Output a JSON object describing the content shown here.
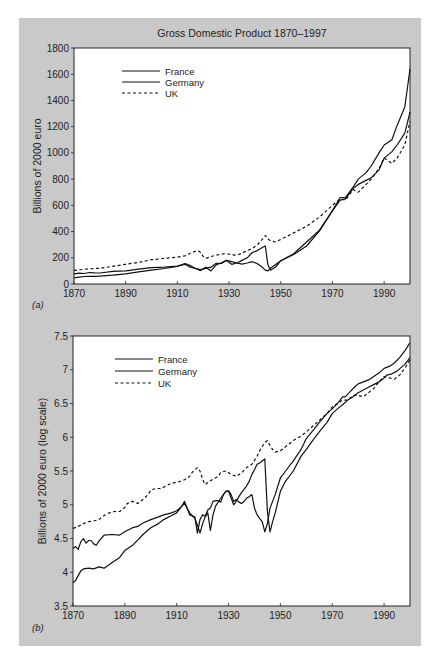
{
  "chart_data": [
    {
      "id": "a",
      "panel_label": "(a)",
      "type": "line",
      "title": "Gross Domestic Product 1870–1997",
      "xlabel": "",
      "ylabel": "Billions of 2000 euro",
      "xlim": [
        1870,
        2000
      ],
      "ylim": [
        0,
        1800
      ],
      "xticks": [
        1870,
        1890,
        1910,
        1930,
        1950,
        1970,
        1990
      ],
      "yticks": [
        0,
        200,
        400,
        600,
        800,
        1000,
        1200,
        1400,
        1600,
        1800
      ],
      "ytick_labels": [
        "0",
        "200",
        "400",
        "600",
        "800",
        "1000",
        "1200",
        "1400",
        "1600",
        "1800"
      ],
      "grid": false,
      "legend": "top-left",
      "series": [
        {
          "name": "France",
          "style": "solid",
          "x": [
            1870,
            1872,
            1874,
            1876,
            1878,
            1880,
            1885,
            1890,
            1895,
            1900,
            1905,
            1910,
            1912,
            1913,
            1915,
            1917,
            1919,
            1921,
            1923,
            1925,
            1927,
            1929,
            1931,
            1933,
            1935,
            1937,
            1939,
            1941,
            1943,
            1944,
            1945,
            1946,
            1948,
            1950,
            1955,
            1960,
            1965,
            1970,
            1973,
            1975,
            1978,
            1980,
            1983,
            1985,
            1988,
            1990,
            1993,
            1995,
            1998,
            2000
          ],
          "y": [
            77,
            82,
            80,
            88,
            85,
            84,
            96,
            100,
            113,
            125,
            128,
            136,
            145,
            150,
            128,
            118,
            110,
            120,
            128,
            158,
            156,
            180,
            170,
            160,
            152,
            160,
            170,
            155,
            125,
            105,
            100,
            120,
            148,
            178,
            230,
            320,
            410,
            560,
            660,
            660,
            740,
            800,
            850,
            900,
            1000,
            1060,
            1100,
            1210,
            1350,
            1640
          ]
        },
        {
          "name": "Germany",
          "style": "solid",
          "x": [
            1870,
            1872,
            1874,
            1876,
            1878,
            1880,
            1885,
            1890,
            1895,
            1900,
            1905,
            1910,
            1912,
            1913,
            1915,
            1917,
            1919,
            1921,
            1923,
            1925,
            1927,
            1929,
            1931,
            1933,
            1935,
            1937,
            1939,
            1941,
            1943,
            1944,
            1945,
            1946,
            1948,
            1950,
            1955,
            1960,
            1965,
            1970,
            1973,
            1975,
            1978,
            1980,
            1983,
            1985,
            1988,
            1990,
            1993,
            1995,
            1998,
            2000
          ],
          "y": [
            47,
            52,
            57,
            58,
            58,
            60,
            68,
            78,
            92,
            106,
            118,
            134,
            150,
            156,
            140,
            118,
            102,
            128,
            100,
            146,
            162,
            180,
            150,
            160,
            180,
            200,
            240,
            255,
            280,
            290,
            150,
            105,
            130,
            178,
            225,
            290,
            405,
            560,
            640,
            650,
            730,
            760,
            790,
            810,
            870,
            960,
            1010,
            1060,
            1150,
            1310
          ]
        },
        {
          "name": "UK",
          "style": "dashed",
          "x": [
            1870,
            1872,
            1874,
            1876,
            1878,
            1880,
            1885,
            1890,
            1895,
            1900,
            1905,
            1910,
            1913,
            1915,
            1917,
            1918,
            1919,
            1920,
            1921,
            1923,
            1925,
            1927,
            1929,
            1931,
            1933,
            1935,
            1937,
            1939,
            1941,
            1943,
            1944,
            1945,
            1946,
            1948,
            1950,
            1955,
            1960,
            1965,
            1970,
            1973,
            1975,
            1978,
            1980,
            1983,
            1985,
            1988,
            1990,
            1993,
            1995,
            1998,
            2000
          ],
          "y": [
            102,
            108,
            112,
            116,
            118,
            120,
            135,
            150,
            165,
            185,
            195,
            205,
            215,
            235,
            250,
            255,
            240,
            210,
            195,
            210,
            220,
            228,
            232,
            222,
            220,
            235,
            255,
            270,
            300,
            345,
            370,
            345,
            330,
            320,
            340,
            390,
            440,
            510,
            600,
            650,
            640,
            720,
            700,
            760,
            800,
            880,
            960,
            920,
            960,
            1060,
            1240
          ]
        }
      ]
    },
    {
      "id": "b",
      "panel_label": "(b)",
      "type": "line",
      "title": "",
      "xlabel": "",
      "ylabel": "Billions of 2000 euro (log scale)",
      "xlim": [
        1870,
        2000
      ],
      "ylim": [
        3.5,
        7.5
      ],
      "xticks": [
        1870,
        1890,
        1910,
        1930,
        1950,
        1970,
        1990
      ],
      "yticks": [
        3.5,
        4,
        4.5,
        5,
        5.5,
        6,
        6.5,
        7,
        7.5
      ],
      "ytick_labels": [
        "3.5",
        "4",
        "4.5",
        "5",
        "5.5",
        "6",
        "6.5",
        "7",
        "7.5"
      ],
      "grid": false,
      "legend": "top-left",
      "series": [
        {
          "name": "France",
          "style": "solid",
          "x": [
            1870,
            1871,
            1872,
            1873,
            1874,
            1875,
            1876,
            1877,
            1878,
            1879,
            1880,
            1882,
            1885,
            1888,
            1890,
            1893,
            1895,
            1897,
            1900,
            1903,
            1905,
            1908,
            1910,
            1912,
            1913,
            1914,
            1915,
            1917,
            1918,
            1919,
            1920,
            1921,
            1922,
            1923,
            1924,
            1925,
            1926,
            1927,
            1928,
            1929,
            1930,
            1931,
            1932,
            1933,
            1934,
            1935,
            1936,
            1937,
            1938,
            1939,
            1940,
            1941,
            1942,
            1943,
            1944,
            1945,
            1946,
            1947,
            1948,
            1950,
            1952,
            1955,
            1958,
            1960,
            1963,
            1965,
            1968,
            1970,
            1972,
            1974,
            1975,
            1977,
            1979,
            1980,
            1982,
            1984,
            1986,
            1988,
            1990,
            1992,
            1994,
            1996,
            1998,
            2000
          ],
          "y": [
            4.35,
            4.38,
            4.34,
            4.45,
            4.5,
            4.43,
            4.47,
            4.47,
            4.42,
            4.4,
            4.46,
            4.55,
            4.56,
            4.55,
            4.6,
            4.66,
            4.68,
            4.73,
            4.78,
            4.82,
            4.85,
            4.88,
            4.91,
            4.98,
            5.02,
            4.95,
            4.85,
            4.82,
            4.58,
            4.78,
            4.85,
            4.83,
            4.92,
            4.95,
            5.05,
            5.06,
            5.06,
            5.04,
            5.15,
            5.2,
            5.21,
            5.15,
            5.05,
            5.08,
            5.04,
            5.02,
            5.05,
            5.1,
            5.12,
            5.15,
            4.95,
            4.85,
            4.8,
            4.75,
            4.6,
            4.72,
            4.95,
            5.05,
            5.15,
            5.4,
            5.5,
            5.65,
            5.82,
            5.98,
            6.12,
            6.22,
            6.35,
            6.42,
            6.5,
            6.6,
            6.6,
            6.68,
            6.76,
            6.79,
            6.82,
            6.85,
            6.9,
            6.95,
            7.02,
            7.05,
            7.1,
            7.18,
            7.28,
            7.4
          ]
        },
        {
          "name": "Germany",
          "style": "solid",
          "x": [
            1870,
            1871,
            1872,
            1873,
            1874,
            1876,
            1878,
            1880,
            1882,
            1885,
            1888,
            1890,
            1893,
            1895,
            1897,
            1900,
            1903,
            1905,
            1908,
            1910,
            1912,
            1913,
            1914,
            1915,
            1917,
            1918,
            1919,
            1920,
            1921,
            1922,
            1923,
            1924,
            1925,
            1927,
            1929,
            1930,
            1931,
            1932,
            1933,
            1934,
            1935,
            1937,
            1938,
            1939,
            1940,
            1941,
            1942,
            1943,
            1944,
            1945,
            1946,
            1947,
            1948,
            1950,
            1952,
            1955,
            1958,
            1960,
            1963,
            1965,
            1968,
            1970,
            1972,
            1974,
            1976,
            1978,
            1980,
            1982,
            1984,
            1986,
            1988,
            1990,
            1991,
            1993,
            1995,
            1998,
            2000
          ],
          "y": [
            3.85,
            3.88,
            3.95,
            4.02,
            4.05,
            4.06,
            4.05,
            4.08,
            4.06,
            4.14,
            4.22,
            4.32,
            4.4,
            4.48,
            4.56,
            4.66,
            4.72,
            4.78,
            4.84,
            4.88,
            4.98,
            5.05,
            4.95,
            4.88,
            4.8,
            4.7,
            4.58,
            4.72,
            4.82,
            4.88,
            4.62,
            4.85,
            4.98,
            5.1,
            5.2,
            5.2,
            5.1,
            5.0,
            5.05,
            5.12,
            5.18,
            5.28,
            5.35,
            5.45,
            5.52,
            5.6,
            5.62,
            5.65,
            5.68,
            4.9,
            4.6,
            4.75,
            4.88,
            5.2,
            5.35,
            5.5,
            5.72,
            5.82,
            5.98,
            6.08,
            6.22,
            6.35,
            6.42,
            6.48,
            6.55,
            6.6,
            6.66,
            6.7,
            6.74,
            6.78,
            6.82,
            6.88,
            6.92,
            6.94,
            6.98,
            7.08,
            7.18
          ]
        },
        {
          "name": "UK",
          "style": "dashed",
          "x": [
            1870,
            1872,
            1874,
            1876,
            1878,
            1880,
            1882,
            1884,
            1886,
            1888,
            1890,
            1891,
            1893,
            1895,
            1897,
            1899,
            1900,
            1902,
            1904,
            1906,
            1908,
            1910,
            1913,
            1915,
            1916,
            1917,
            1918,
            1919,
            1920,
            1921,
            1922,
            1924,
            1926,
            1927,
            1929,
            1931,
            1933,
            1935,
            1937,
            1939,
            1941,
            1942,
            1943,
            1944,
            1945,
            1946,
            1947,
            1948,
            1950,
            1952,
            1955,
            1958,
            1960,
            1963,
            1965,
            1968,
            1970,
            1972,
            1974,
            1976,
            1978,
            1980,
            1982,
            1984,
            1986,
            1988,
            1990,
            1992,
            1994,
            1996,
            1998,
            2000
          ],
          "y": [
            4.65,
            4.68,
            4.72,
            4.75,
            4.76,
            4.78,
            4.84,
            4.88,
            4.9,
            4.9,
            4.96,
            5.02,
            5.05,
            5.02,
            5.08,
            5.15,
            5.22,
            5.24,
            5.24,
            5.28,
            5.32,
            5.33,
            5.37,
            5.42,
            5.48,
            5.52,
            5.55,
            5.5,
            5.38,
            5.3,
            5.33,
            5.38,
            5.42,
            5.48,
            5.5,
            5.45,
            5.42,
            5.47,
            5.55,
            5.6,
            5.72,
            5.8,
            5.86,
            5.92,
            5.95,
            5.88,
            5.82,
            5.78,
            5.8,
            5.86,
            5.95,
            6.02,
            6.08,
            6.18,
            6.25,
            6.35,
            6.45,
            6.5,
            6.55,
            6.55,
            6.62,
            6.62,
            6.6,
            6.66,
            6.72,
            6.82,
            6.9,
            6.88,
            6.86,
            6.92,
            7.02,
            7.15
          ]
        }
      ]
    }
  ]
}
